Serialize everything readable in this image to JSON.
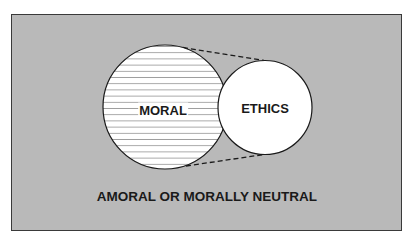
{
  "diagram": {
    "type": "venn-style concept diagram",
    "background_color": "#b9b9b9",
    "circles": [
      {
        "id": "moral",
        "label": "MORAL",
        "fill": "horizontal-hatch",
        "cx": 165,
        "cy": 107,
        "r": 62
      },
      {
        "id": "ethics",
        "label": "ETHICS",
        "fill": "#ffffff",
        "cx": 265,
        "cy": 107.5,
        "r": 47
      }
    ],
    "connectors": "dashed tangent lines from MORAL circle to ETHICS circle",
    "surrounding_region_label": "AMORAL OR MORALLY NEUTRAL"
  }
}
